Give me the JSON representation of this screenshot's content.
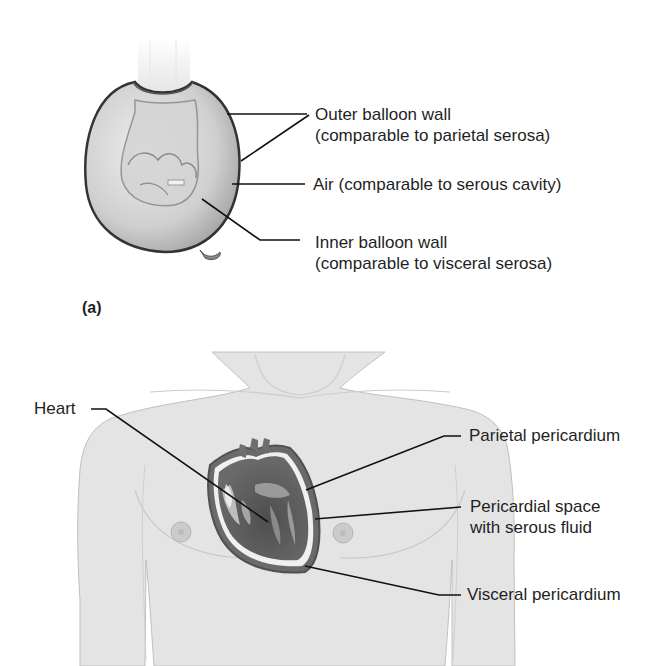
{
  "panel_a": {
    "panel_label": "(a)",
    "labels": {
      "outer_wall_line1": "Outer balloon wall",
      "outer_wall_line2": "(comparable to parietal serosa)",
      "air": "Air (comparable to serous cavity)",
      "inner_wall_line1": "Inner balloon wall",
      "inner_wall_line2": "(comparable to visceral serosa)"
    }
  },
  "panel_b": {
    "labels": {
      "heart": "Heart",
      "parietal": "Parietal pericardium",
      "space_line1": "Pericardial space",
      "space_line2": "with serous fluid",
      "visceral": "Visceral pericardium"
    }
  },
  "colors": {
    "background": "#ffffff",
    "skin": "#e2e2e2",
    "heart_dark": "#5a5a5a",
    "leader_line": "#111111"
  }
}
